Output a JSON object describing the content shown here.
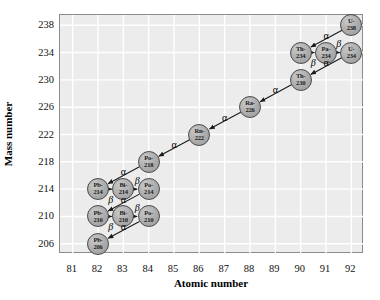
{
  "chart_data": {
    "type": "scatter",
    "title": "",
    "xlabel": "Atomic number",
    "ylabel": "Mass number",
    "xlim": [
      80.5,
      92.5
    ],
    "ylim": [
      204.5,
      239.5
    ],
    "xticks": [
      81,
      82,
      83,
      84,
      85,
      86,
      87,
      88,
      89,
      90,
      91,
      92
    ],
    "yticks": [
      206,
      210,
      214,
      218,
      222,
      226,
      230,
      234,
      238
    ],
    "grid": true,
    "legend": "none",
    "colors": {
      "plot_background": "#ececec",
      "gridline": "#ffffff",
      "node_fill": "#ababab",
      "node_border": "#4a4a4a",
      "arrow": "#1a1a1a",
      "frame": "#8c8c8c"
    },
    "nodes": [
      {
        "id": "U238",
        "element": "U-",
        "mass": "238",
        "x": 92,
        "y": 238
      },
      {
        "id": "Th234",
        "element": "Th-",
        "mass": "234",
        "x": 90,
        "y": 234
      },
      {
        "id": "Pa234",
        "element": "Pa-",
        "mass": "234",
        "x": 91,
        "y": 234
      },
      {
        "id": "U234",
        "element": "U-",
        "mass": "234",
        "x": 92,
        "y": 234
      },
      {
        "id": "Th230",
        "element": "Th-",
        "mass": "230",
        "x": 90,
        "y": 230
      },
      {
        "id": "Ra226",
        "element": "Ra-",
        "mass": "226",
        "x": 88,
        "y": 226
      },
      {
        "id": "Rn222",
        "element": "Rn-",
        "mass": "222",
        "x": 86,
        "y": 222
      },
      {
        "id": "Po218",
        "element": "Po-",
        "mass": "218",
        "x": 84,
        "y": 218
      },
      {
        "id": "Pb214",
        "element": "Pb-",
        "mass": "214",
        "x": 82,
        "y": 214
      },
      {
        "id": "Bi214",
        "element": "Bi-",
        "mass": "214",
        "x": 83,
        "y": 214
      },
      {
        "id": "Po214",
        "element": "Po-",
        "mass": "214",
        "x": 84,
        "y": 214
      },
      {
        "id": "Pb210",
        "element": "Pb-",
        "mass": "210",
        "x": 82,
        "y": 210
      },
      {
        "id": "Bi210",
        "element": "Bi-",
        "mass": "210",
        "x": 83,
        "y": 210
      },
      {
        "id": "Po210",
        "element": "Po-",
        "mass": "210",
        "x": 84,
        "y": 210
      },
      {
        "id": "Pb206",
        "element": "Pb-",
        "mass": "206",
        "x": 82,
        "y": 206
      }
    ],
    "decays": [
      {
        "from": "U238",
        "to": "Th234",
        "mode": "α",
        "label_x": 91.0,
        "label_y": 236.6
      },
      {
        "from": "Th234",
        "to": "Pa234",
        "mode": "β",
        "label_x": 90.5,
        "label_y": 232.6
      },
      {
        "from": "Pa234",
        "to": "U234",
        "mode": "β",
        "label_x": 91.5,
        "label_y": 235.4
      },
      {
        "from": "U234",
        "to": "Th230",
        "mode": "α",
        "label_x": 91.0,
        "label_y": 232.6
      },
      {
        "from": "Th230",
        "to": "Ra226",
        "mode": "α",
        "label_x": 89.0,
        "label_y": 228.6
      },
      {
        "from": "Ra226",
        "to": "Rn222",
        "mode": "α",
        "label_x": 87.0,
        "label_y": 224.6
      },
      {
        "from": "Rn222",
        "to": "Po218",
        "mode": "α",
        "label_x": 85.0,
        "label_y": 220.6
      },
      {
        "from": "Po218",
        "to": "Pb214",
        "mode": "α",
        "label_x": 83.0,
        "label_y": 216.6
      },
      {
        "from": "Pb214",
        "to": "Bi214",
        "mode": "β",
        "label_x": 82.5,
        "label_y": 212.6
      },
      {
        "from": "Bi214",
        "to": "Po214",
        "mode": "β",
        "label_x": 83.55,
        "label_y": 215.4
      },
      {
        "from": "Po214",
        "to": "Pb210",
        "mode": "α",
        "label_x": 83.0,
        "label_y": 212.6
      },
      {
        "from": "Pb210",
        "to": "Bi210",
        "mode": "β",
        "label_x": 82.5,
        "label_y": 208.6
      },
      {
        "from": "Bi210",
        "to": "Po210",
        "mode": "β",
        "label_x": 83.55,
        "label_y": 211.4
      },
      {
        "from": "Po210",
        "to": "Pb206",
        "mode": "α",
        "label_x": 83.0,
        "label_y": 208.6
      }
    ]
  }
}
